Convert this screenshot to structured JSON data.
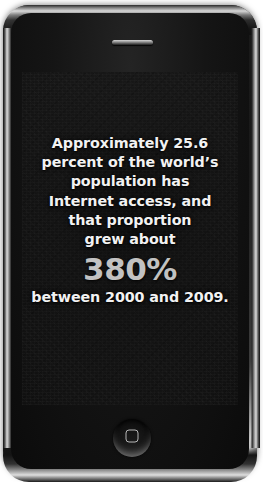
{
  "device": {
    "type": "smartphone",
    "speaker_label": "earpiece-speaker",
    "home_button_label": "home-button"
  },
  "screen": {
    "background_color": "#151515",
    "text_color": "#f2f2f2",
    "accent_color": "#c2c2c2",
    "message_lines": [
      "Approximately 25.6",
      "percent of the world’s",
      "population has",
      "Internet access, and",
      "that proportion",
      "grew about"
    ],
    "big_stat": "380%",
    "closing_line": "between 2000 and 2009.",
    "full_text": "Approximately 25.6 percent of the world’s population has Internet access, and that proportion grew about 380% between 2000 and 2009."
  }
}
